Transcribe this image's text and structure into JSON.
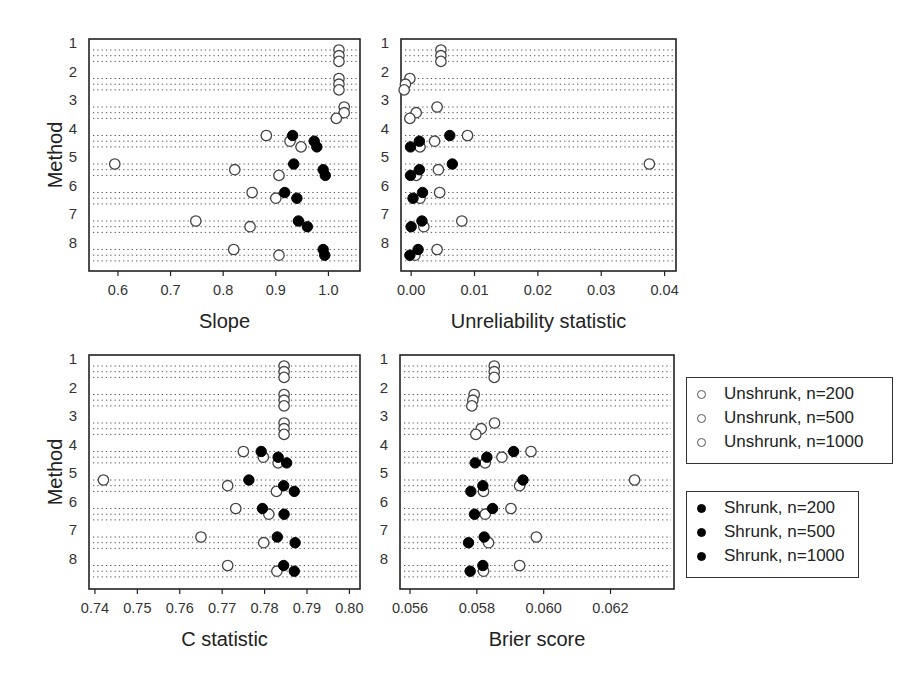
{
  "chart_data": [
    {
      "type": "scatter",
      "title": "",
      "xlabel": "Slope",
      "ylabel": "Method",
      "xlim": [
        0.545,
        1.06
      ],
      "x_ticks": [
        0.6,
        0.7,
        0.8,
        0.9,
        1.0
      ],
      "x_tick_labels": [
        "0.6",
        "0.7",
        "0.8",
        "0.9",
        "1.0"
      ],
      "y_tick_labels": [
        "1",
        "2",
        "3",
        "4",
        "5",
        "6",
        "7",
        "8"
      ],
      "grid": "dotted horizontal line per method x sample size",
      "sample_sizes": [
        "n=200",
        "n=500",
        "n=1000"
      ],
      "series": [
        {
          "name": "Unshrunk",
          "marker": "open",
          "values": [
            [
              1.02,
              1.02,
              1.02
            ],
            [
              1.02,
              1.02,
              1.02
            ],
            [
              1.03,
              1.03,
              1.015
            ],
            [
              0.882,
              0.927,
              0.948
            ],
            [
              0.594,
              0.822,
              0.906
            ],
            [
              0.855,
              0.9,
              null
            ],
            [
              0.748,
              0.851,
              null
            ],
            [
              0.82,
              0.906,
              null
            ]
          ]
        },
        {
          "name": "Shrunk",
          "marker": "filled",
          "values": [
            [
              null,
              null,
              null
            ],
            [
              null,
              null,
              null
            ],
            [
              null,
              null,
              null
            ],
            [
              0.932,
              0.973,
              0.978
            ],
            [
              0.934,
              0.99,
              0.994
            ],
            [
              0.917,
              0.94,
              null
            ],
            [
              0.943,
              0.96,
              null
            ],
            [
              0.99,
              0.993,
              null
            ]
          ]
        }
      ]
    },
    {
      "type": "scatter",
      "title": "",
      "xlabel": "Unreliability statistic",
      "ylabel": "",
      "xlim": [
        -0.0016,
        0.0418
      ],
      "x_ticks": [
        0.0,
        0.01,
        0.02,
        0.03,
        0.04
      ],
      "x_tick_labels": [
        "0.00",
        "0.01",
        "0.02",
        "0.03",
        "0.04"
      ],
      "y_tick_labels": [
        "1",
        "2",
        "3",
        "4",
        "5",
        "6",
        "7",
        "8"
      ],
      "sample_sizes": [
        "n=200",
        "n=500",
        "n=1000"
      ],
      "series": [
        {
          "name": "Unshrunk",
          "marker": "open",
          "values": [
            [
              0.0047,
              0.0047,
              0.0047
            ],
            [
              -0.0002,
              -0.0009,
              -0.0011
            ],
            [
              0.0041,
              0.0008,
              -0.0002
            ],
            [
              0.0089,
              0.0037,
              0.0014
            ],
            [
              0.0376,
              0.0043,
              0.0008
            ],
            [
              0.0045,
              0.0014,
              null
            ],
            [
              0.008,
              0.002,
              null
            ],
            [
              0.0041,
              0.0006,
              null
            ]
          ]
        },
        {
          "name": "Shrunk",
          "marker": "filled",
          "values": [
            [
              null,
              null,
              null
            ],
            [
              null,
              null,
              null
            ],
            [
              null,
              null,
              null
            ],
            [
              0.0061,
              0.0013,
              -0.0001
            ],
            [
              0.0065,
              0.0013,
              -0.0001
            ],
            [
              0.0018,
              0.0003,
              null
            ],
            [
              0.0017,
              0.0,
              null
            ],
            [
              0.0011,
              -0.0002,
              null
            ]
          ]
        }
      ]
    },
    {
      "type": "scatter",
      "title": "",
      "xlabel": "C statistic",
      "ylabel": "Method",
      "xlim": [
        0.7386,
        0.8025
      ],
      "x_ticks": [
        0.74,
        0.75,
        0.76,
        0.77,
        0.78,
        0.79,
        0.8
      ],
      "x_tick_labels": [
        "0.74",
        "0.75",
        "0.76",
        "0.77",
        "0.78",
        "0.79",
        "0.80"
      ],
      "y_tick_labels": [
        "1",
        "2",
        "3",
        "4",
        "5",
        "6",
        "7",
        "8"
      ],
      "sample_sizes": [
        "n=200",
        "n=500",
        "n=1000"
      ],
      "series": [
        {
          "name": "Unshrunk",
          "marker": "open",
          "values": [
            [
              0.7846,
              0.7846,
              0.7846
            ],
            [
              0.7846,
              0.7846,
              0.7846
            ],
            [
              0.7846,
              0.7846,
              0.7846
            ],
            [
              0.775,
              0.7797,
              0.7832
            ],
            [
              0.742,
              0.7713,
              0.7828
            ],
            [
              0.7732,
              0.781,
              null
            ],
            [
              0.765,
              0.7798,
              null
            ],
            [
              0.7713,
              0.7829,
              null
            ]
          ]
        },
        {
          "name": "Shrunk",
          "marker": "filled",
          "values": [
            [
              null,
              null,
              null
            ],
            [
              null,
              null,
              null
            ],
            [
              null,
              null,
              null
            ],
            [
              0.7792,
              0.7832,
              0.7852
            ],
            [
              0.7763,
              0.7845,
              0.787
            ],
            [
              0.7795,
              0.7846,
              null
            ],
            [
              0.783,
              0.7872,
              null
            ],
            [
              0.7845,
              0.787,
              null
            ]
          ]
        }
      ]
    },
    {
      "type": "scatter",
      "title": "",
      "xlabel": "Brier score",
      "ylabel": "",
      "xlim": [
        0.0557,
        0.0639
      ],
      "x_ticks": [
        0.056,
        0.058,
        0.06,
        0.062
      ],
      "x_tick_labels": [
        "0.056",
        "0.058",
        "0.060",
        "0.062"
      ],
      "y_tick_labels": [
        "1",
        "2",
        "3",
        "4",
        "5",
        "6",
        "7",
        "8"
      ],
      "sample_sizes": [
        "n=200",
        "n=500",
        "n=1000"
      ],
      "series": [
        {
          "name": "Unshrunk",
          "marker": "open",
          "values": [
            [
              0.05852,
              0.05852,
              0.05852
            ],
            [
              0.05792,
              0.05788,
              0.05785
            ],
            [
              0.05853,
              0.05813,
              0.05797
            ],
            [
              0.05962,
              0.05875,
              0.05825
            ],
            [
              0.06272,
              0.05928,
              0.0582
            ],
            [
              0.05902,
              0.05825,
              null
            ],
            [
              0.05978,
              0.05835,
              null
            ],
            [
              0.05928,
              0.0582,
              null
            ]
          ]
        },
        {
          "name": "Shrunk",
          "marker": "filled",
          "values": [
            [
              null,
              null,
              null
            ],
            [
              null,
              null,
              null
            ],
            [
              null,
              null,
              null
            ],
            [
              0.0591,
              0.0583,
              0.05795
            ],
            [
              0.05938,
              0.05818,
              0.05782
            ],
            [
              0.05847,
              0.05793,
              null
            ],
            [
              0.05822,
              0.05775,
              null
            ],
            [
              0.05818,
              0.0578,
              null
            ]
          ]
        }
      ]
    }
  ],
  "panels": [
    {
      "id": "slope",
      "xlabel": "Slope",
      "ylabel": "Method"
    },
    {
      "id": "unreliability",
      "xlabel": "Unreliability statistic",
      "ylabel": ""
    },
    {
      "id": "cstat",
      "xlabel": "C statistic",
      "ylabel": "Method"
    },
    {
      "id": "brier",
      "xlabel": "Brier score",
      "ylabel": ""
    }
  ],
  "legend_unshrunk": {
    "items": [
      "Unshrunk, n=200",
      "Unshrunk, n=500",
      "Unshrunk, n=1000"
    ]
  },
  "legend_shrunk": {
    "items": [
      "Shrunk, n=200",
      "Shrunk, n=500",
      "Shrunk, n=1000"
    ]
  },
  "colors": {
    "open_marker_stroke": "#444444",
    "filled_marker": "#000000",
    "grid": "#555555",
    "axis": "#222222"
  }
}
